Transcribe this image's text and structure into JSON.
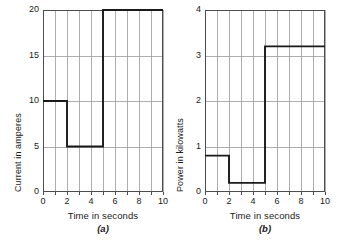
{
  "figure": {
    "background": "#ffffff",
    "line_color": "#1a1a1a",
    "grid_color": "#9a9a9a",
    "axis_color": "#4d4d4d"
  },
  "chart_data": [
    {
      "type": "line",
      "panel": "a",
      "caption": "(a)",
      "title": "",
      "xlabel": "Time in seconds",
      "ylabel": "Current in amperes",
      "xlim": [
        0,
        10
      ],
      "ylim": [
        0,
        20
      ],
      "xticks": [
        0,
        1,
        2,
        3,
        4,
        5,
        6,
        7,
        8,
        9,
        10
      ],
      "xticklabels": [
        "0",
        "",
        "2",
        "",
        "4",
        "",
        "6",
        "",
        "8",
        "",
        "10"
      ],
      "yticks": [
        0,
        5,
        10,
        15,
        20
      ],
      "yticklabels": [
        "0",
        "5",
        "10",
        "15",
        "20"
      ],
      "grid": true,
      "legend": null,
      "step_segments": [
        {
          "x_start": 0,
          "x_end": 2,
          "y": 10
        },
        {
          "x_start": 2,
          "x_end": 5,
          "y": 5
        },
        {
          "x_start": 5,
          "x_end": 10,
          "y": 20
        }
      ],
      "x": [
        0,
        2,
        2,
        5,
        5,
        10
      ],
      "y": [
        10,
        10,
        5,
        5,
        20,
        20
      ]
    },
    {
      "type": "line",
      "panel": "b",
      "caption": "(b)",
      "title": "",
      "xlabel": "Time in seconds",
      "ylabel": "Power in kilowatts",
      "xlim": [
        0,
        10
      ],
      "ylim": [
        0,
        4
      ],
      "xticks": [
        0,
        1,
        2,
        3,
        4,
        5,
        6,
        7,
        8,
        9,
        10
      ],
      "xticklabels": [
        "0",
        "",
        "2",
        "",
        "4",
        "",
        "6",
        "",
        "8",
        "",
        "10"
      ],
      "yticks": [
        0,
        1,
        2,
        3,
        4
      ],
      "yticklabels": [
        "0",
        "1",
        "2",
        "3",
        "4"
      ],
      "grid": true,
      "legend": null,
      "step_segments": [
        {
          "x_start": 0,
          "x_end": 2,
          "y": 0.8
        },
        {
          "x_start": 2,
          "x_end": 5,
          "y": 0.2
        },
        {
          "x_start": 5,
          "x_end": 10,
          "y": 3.2
        }
      ],
      "x": [
        0,
        2,
        2,
        5,
        5,
        10
      ],
      "y": [
        0.8,
        0.8,
        0.2,
        0.2,
        3.2,
        3.2
      ]
    }
  ]
}
